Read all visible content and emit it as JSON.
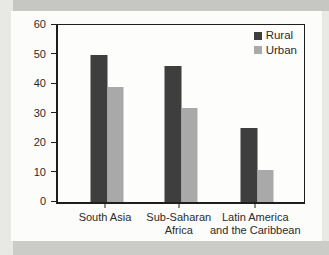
{
  "chart_data": {
    "type": "bar",
    "title": "",
    "xlabel": "",
    "ylabel": "",
    "categories": [
      "South Asia",
      "Sub-Saharan Africa",
      "Latin America and the Caribbean"
    ],
    "category_lines": [
      [
        "South Asia"
      ],
      [
        "Sub-Saharan",
        "Africa"
      ],
      [
        "Latin America",
        "and the Caribbean"
      ]
    ],
    "series": [
      {
        "name": "Rural",
        "color": "#3e3e3e",
        "values": [
          50,
          46,
          25
        ]
      },
      {
        "name": "Urban",
        "color": "#a9a9a9",
        "values": [
          39,
          32,
          11
        ]
      }
    ],
    "ylim": [
      0,
      60
    ],
    "yticks": [
      0,
      10,
      20,
      30,
      40,
      50,
      60
    ],
    "grid": false,
    "legend_position": "top-right"
  },
  "colors": {
    "axis": "#1e1e1e",
    "text": "#2b2b2b",
    "panel_background": "#fcfcfa",
    "page_background": "#e8e8e5",
    "top_band": "#c6c6c3",
    "bottom_band": "#cbcbc8"
  }
}
